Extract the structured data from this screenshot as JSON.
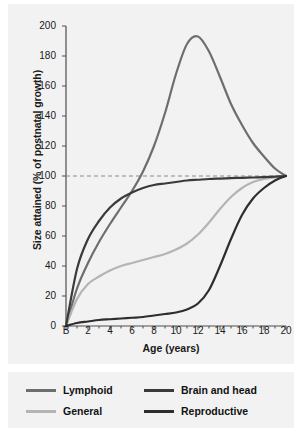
{
  "chart_data": {
    "type": "line",
    "title": "",
    "xlabel": "Age (years)",
    "ylabel": "Size attained (% of postnatal growth)",
    "xlim": [
      0,
      20
    ],
    "ylim": [
      0,
      200
    ],
    "grid": false,
    "legend_position": "bottom",
    "xticks": [
      "B",
      "2",
      "4",
      "6",
      "8",
      "10",
      "12",
      "14",
      "16",
      "18",
      "20"
    ],
    "xtick_values": [
      0,
      2,
      4,
      6,
      8,
      10,
      12,
      14,
      16,
      18,
      20
    ],
    "yticks": [
      "0",
      "20",
      "40",
      "60",
      "80",
      "100",
      "120",
      "140",
      "160",
      "180",
      "200"
    ],
    "ytick_values": [
      0,
      20,
      40,
      60,
      80,
      100,
      120,
      140,
      160,
      180,
      200
    ],
    "annotations": [
      {
        "type": "reference-line",
        "axis": "y",
        "value": 100,
        "style": "dashed",
        "color": "#8a8a8a"
      }
    ],
    "x": [
      0,
      1,
      2,
      3,
      4,
      5,
      6,
      7,
      8,
      9,
      10,
      11,
      12,
      13,
      14,
      15,
      16,
      17,
      18,
      19,
      20
    ],
    "series": [
      {
        "name": "Lymphoid",
        "color": "#6e6e6e",
        "values": [
          0,
          25,
          42,
          56,
          68,
          79,
          90,
          103,
          120,
          142,
          168,
          188,
          193,
          183,
          166,
          148,
          134,
          122,
          113,
          105,
          100
        ]
      },
      {
        "name": "General",
        "color": "#b4b4b4",
        "values": [
          0,
          18,
          28,
          33,
          37,
          40,
          42,
          44,
          46,
          48,
          51,
          55,
          61,
          69,
          78,
          86,
          92,
          96,
          98,
          99,
          100
        ]
      },
      {
        "name": "Brain and head",
        "color": "#3a3a3a",
        "values": [
          0,
          38,
          58,
          70,
          79,
          85,
          89,
          92,
          94,
          95,
          96,
          97,
          97.5,
          98,
          98.3,
          98.6,
          98.8,
          99,
          99.3,
          99.6,
          100
        ]
      },
      {
        "name": "Reproductive",
        "color": "#2e2e2e",
        "values": [
          0,
          2,
          3,
          4,
          4.5,
          5,
          5.5,
          6,
          7,
          8,
          9,
          11,
          15,
          24,
          40,
          58,
          74,
          85,
          92,
          97,
          100
        ]
      }
    ]
  },
  "legend": {
    "items": [
      {
        "label": "Lymphoid",
        "color": "#6e6e6e"
      },
      {
        "label": "Brain and head",
        "color": "#3a3a3a"
      },
      {
        "label": "General",
        "color": "#b4b4b4"
      },
      {
        "label": "Reproductive",
        "color": "#2e2e2e"
      }
    ]
  },
  "colors": {
    "panel_background": "#f2f2f2",
    "page_background": "#ffffff",
    "axis": "#4d4d4d",
    "text": "#1a1a1a",
    "reference_line": "#8a8a8a"
  }
}
